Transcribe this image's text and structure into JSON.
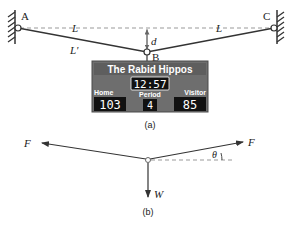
{
  "figure": {
    "part_a": {
      "caption": "(a)",
      "points": {
        "A": "A",
        "B": "B",
        "C": "C"
      },
      "labels": {
        "L_left": "L",
        "L_right": "L",
        "L_prime": "L'",
        "d": "d"
      },
      "scoreboard": {
        "team_name": "The Rabid Hippos",
        "clock": "12:57",
        "home_label": "Home",
        "home_score": "103",
        "period_label": "Period",
        "period": "4",
        "visitor_label": "Visitor",
        "visitor_score": "85",
        "colors": {
          "body": "#6e6e6e",
          "border": "#4a4a4a",
          "display": "#111111",
          "text": "#ffffff"
        }
      }
    },
    "part_b": {
      "caption": "(b)",
      "labels": {
        "F_left": "F",
        "F_right": "F",
        "theta": "θ",
        "W": "W"
      }
    },
    "colors": {
      "line": "#333333",
      "dashed": "#888888",
      "hatch": "#333333"
    }
  }
}
